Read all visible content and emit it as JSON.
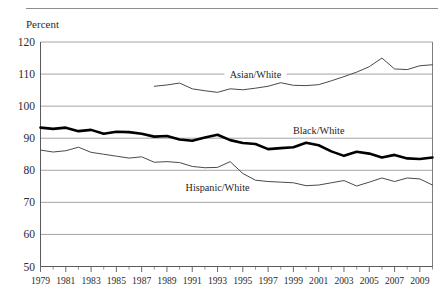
{
  "figure": {
    "y_axis_title": "Percent",
    "top_rule": true
  },
  "chart_data": {
    "type": "line",
    "title": "",
    "subtitle": "",
    "xlabel": "",
    "ylabel": "Percent",
    "ylim": [
      50,
      120
    ],
    "xlim": [
      1979,
      2010
    ],
    "grid": true,
    "legend_position": "inline-annotations",
    "ytick_labels": [
      "120",
      "110",
      "100",
      "90",
      "80",
      "70",
      "60",
      "50"
    ],
    "yticks": [
      120,
      110,
      100,
      90,
      80,
      70,
      60,
      50
    ],
    "xtick_labels": [
      "1979",
      "1981",
      "1983",
      "1985",
      "1987",
      "1989",
      "1991",
      "1993",
      "1995",
      "1997",
      "1999",
      "2001",
      "2003",
      "2005",
      "2007",
      "2009"
    ],
    "xticks_major": [
      1979,
      1981,
      1983,
      1985,
      1987,
      1989,
      1991,
      1993,
      1995,
      1997,
      1999,
      2001,
      2003,
      2005,
      2007,
      2009
    ],
    "xticks_minor": [
      1980,
      1982,
      1984,
      1986,
      1988,
      1990,
      1992,
      1994,
      1996,
      1998,
      2000,
      2002,
      2004,
      2006,
      2008,
      2010
    ],
    "series": [
      {
        "name": "Asian/White",
        "label": "Asian/White",
        "style": "thin",
        "label_x": 1996,
        "label_y": 108.8,
        "x": [
          1988,
          1989,
          1990,
          1991,
          1992,
          1993,
          1994,
          1995,
          1996,
          1997,
          1998,
          1999,
          2000,
          2001,
          2002,
          2003,
          2004,
          2005,
          2006,
          2007,
          2008,
          2009,
          2010
        ],
        "values": [
          106.2,
          106.6,
          107.2,
          105.4,
          104.8,
          104.3,
          105.4,
          105.1,
          105.6,
          106.2,
          107.3,
          106.5,
          106.4,
          106.7,
          107.9,
          109.2,
          110.6,
          112.3,
          115.0,
          111.6,
          111.4,
          112.6,
          112.9
        ]
      },
      {
        "name": "Black/White",
        "label": "Black/White",
        "style": "thick",
        "label_x": 2001,
        "label_y": 91.3,
        "x": [
          1979,
          1980,
          1981,
          1982,
          1983,
          1984,
          1985,
          1986,
          1987,
          1988,
          1989,
          1990,
          1991,
          1992,
          1993,
          1994,
          1995,
          1996,
          1997,
          1998,
          1999,
          2000,
          2001,
          2002,
          2003,
          2004,
          2005,
          2006,
          2007,
          2008,
          2009,
          2010
        ],
        "values": [
          93.3,
          92.9,
          93.3,
          92.2,
          92.6,
          91.4,
          92.0,
          91.9,
          91.4,
          90.5,
          90.7,
          89.6,
          89.2,
          90.2,
          91.1,
          89.4,
          88.5,
          88.2,
          86.6,
          86.9,
          87.2,
          88.6,
          87.8,
          85.9,
          84.5,
          85.8,
          85.2,
          84.0,
          84.8,
          83.7,
          83.5,
          84.0
        ]
      },
      {
        "name": "Hispanic/White",
        "label": "Hispanic/White",
        "style": "thin",
        "label_x": 1993,
        "label_y": 73.4,
        "x": [
          1979,
          1980,
          1981,
          1982,
          1983,
          1984,
          1985,
          1986,
          1987,
          1988,
          1989,
          1990,
          1991,
          1992,
          1993,
          1994,
          1995,
          1996,
          1997,
          1998,
          1999,
          2000,
          2001,
          2002,
          2003,
          2004,
          2005,
          2006,
          2007,
          2008,
          2009,
          2010
        ],
        "values": [
          86.3,
          85.7,
          86.1,
          87.2,
          85.6,
          85.0,
          84.4,
          83.8,
          84.2,
          82.5,
          82.7,
          82.4,
          81.2,
          80.8,
          80.9,
          82.7,
          79.0,
          76.9,
          76.5,
          76.3,
          76.1,
          75.2,
          75.4,
          76.1,
          76.8,
          75.1,
          76.3,
          77.6,
          76.5,
          77.6,
          77.3,
          75.4
        ]
      }
    ]
  }
}
